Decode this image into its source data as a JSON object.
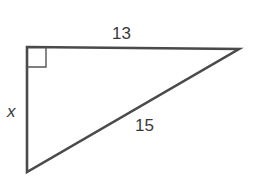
{
  "diagram": {
    "type": "right-triangle",
    "labels": {
      "top_side": "13",
      "left_side": "x",
      "hypotenuse": "15"
    },
    "right_angle_marker": "top-left",
    "colors": {
      "stroke": "#4a4a4a",
      "text": "#3a3a3a",
      "background": "#ffffff"
    }
  }
}
